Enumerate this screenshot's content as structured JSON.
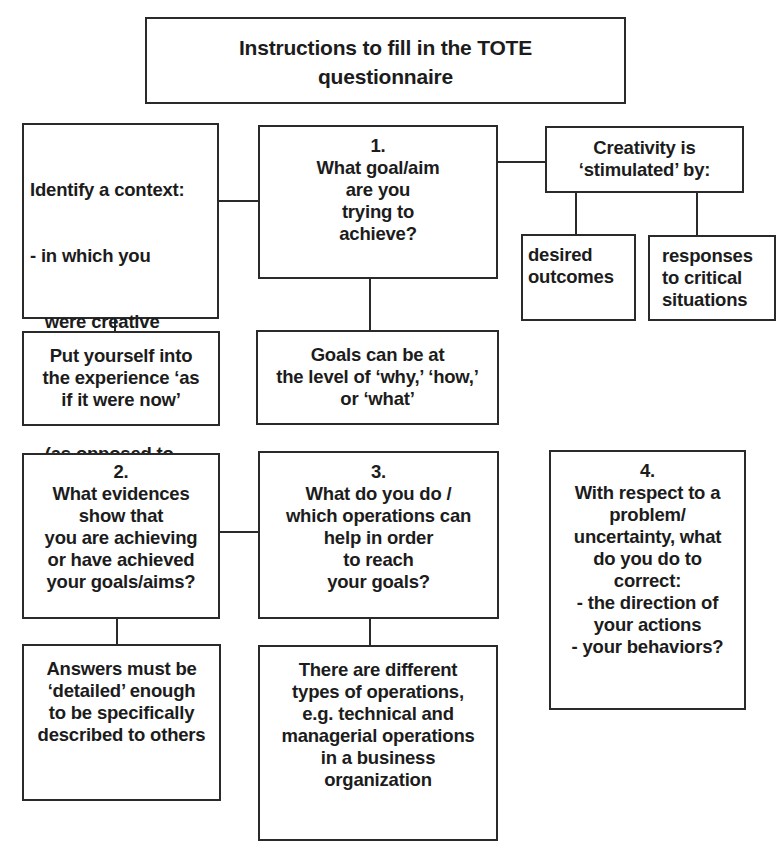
{
  "title": {
    "lines": [
      "Instructions to fill in the TOTE",
      "questionnaire"
    ]
  },
  "context_box": {
    "lines": [
      "Identify a context:",
      "- in which you",
      "   were creative",
      "- of a personal",
      "   (as opposed to",
      "   general) type"
    ]
  },
  "step1": {
    "number": "1.",
    "lines": [
      "What goal/aim",
      "are you",
      "trying to",
      "achieve?"
    ]
  },
  "creativity": {
    "lines": [
      "Creativity is",
      "‘stimulated’ by:"
    ],
    "children": [
      {
        "lines": [
          "desired",
          "outcomes"
        ]
      },
      {
        "lines": [
          "responses",
          "to critical",
          "situations"
        ]
      }
    ]
  },
  "put_yourself": {
    "lines": [
      "Put yourself into",
      "the experience ‘as",
      "if it were now’"
    ]
  },
  "goals_levels": {
    "lines": [
      "Goals can be at",
      "the level of ‘why,’ ‘how,’",
      "or ‘what’"
    ]
  },
  "step2": {
    "number": "2.",
    "lines": [
      "What evidences",
      "show that",
      "you are achieving",
      "or have achieved",
      "your goals/aims?"
    ]
  },
  "step3": {
    "number": "3.",
    "lines": [
      "What do you do /",
      "which operations can",
      "help in order",
      "to reach",
      "your goals?"
    ]
  },
  "step4": {
    "number": "4.",
    "lines": [
      "With respect to a",
      "problem/",
      "uncertainty, what",
      "do you do to",
      "correct:",
      "- the direction of",
      "your actions",
      "- your behaviors?"
    ]
  },
  "answers": {
    "lines": [
      "Answers must be",
      "‘detailed’ enough",
      "to be specifically",
      "described to others"
    ]
  },
  "operations_types": {
    "lines": [
      "There are different",
      "types of operations,",
      "e.g. technical and",
      "managerial operations",
      "in a business",
      "organization"
    ]
  },
  "colors": {
    "border": "#2a2a2a",
    "text": "#1c1c1c",
    "background": "#ffffff"
  }
}
